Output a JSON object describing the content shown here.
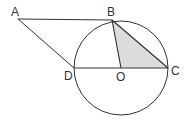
{
  "diagram": {
    "labels": {
      "A": "A",
      "B": "B",
      "C": "C",
      "D": "D",
      "O": "O"
    },
    "colors": {
      "stroke": "#333333",
      "shade": "#dddddd"
    }
  }
}
